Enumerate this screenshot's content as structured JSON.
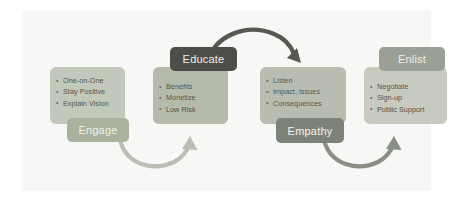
{
  "diagram": {
    "title_present": false,
    "background": "#f7f7f6",
    "stages": [
      {
        "id": "engage",
        "label": "Engage",
        "label_color": "#a8b29c",
        "card_color": "#c3c9ba",
        "bullets": [
          "One-on-One",
          "Stay Positive",
          "Explain Vision"
        ]
      },
      {
        "id": "educate",
        "label": "Educate",
        "label_color": "#4d4d4a",
        "card_color": "#b4bbab",
        "bullets": [
          "Benefits",
          "Monetize",
          "Low Risk"
        ]
      },
      {
        "id": "empathy",
        "label": "Empathy",
        "label_color": "#7e8378",
        "card_color": "#b9bdb1",
        "bullets": [
          "Listen",
          "Impact, Issues",
          "Consequences"
        ]
      },
      {
        "id": "enlist",
        "label": "Enlist",
        "label_color": "#9aa093",
        "card_color": "#c6cabf",
        "bullets": [
          "Negotiate",
          "Sign-up",
          "Public Support"
        ]
      }
    ],
    "connectors": [
      {
        "id": "engage-to-educate",
        "from": "engage",
        "to": "educate",
        "direction": "curve-up-right",
        "color": "#b9bfb2"
      },
      {
        "id": "educate-to-empathy",
        "from": "educate",
        "to": "empathy",
        "direction": "arc-over-right",
        "color": "#575754"
      },
      {
        "id": "empathy-to-enlist",
        "from": "empathy",
        "to": "enlist",
        "direction": "curve-up-right",
        "color": "#8a8f84"
      }
    ]
  }
}
